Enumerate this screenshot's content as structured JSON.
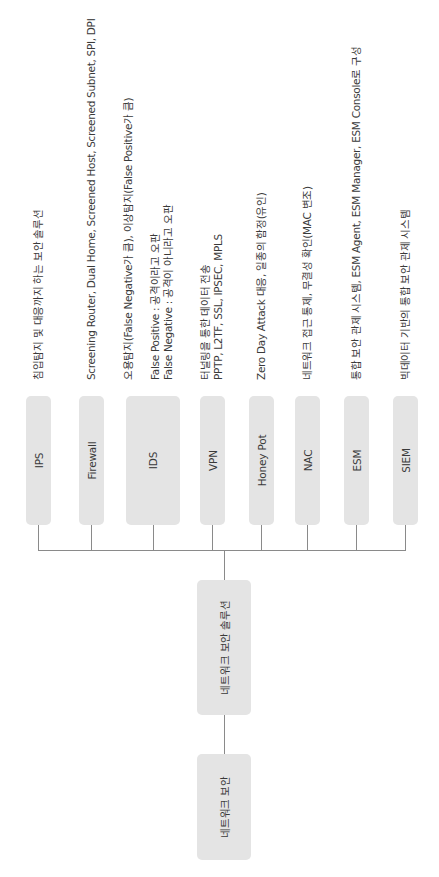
{
  "diagram": {
    "orientation": "rotated-90-ccw",
    "root": {
      "label": "네트워크 보안"
    },
    "middle": {
      "label": "네트워크 보안 솔루션"
    },
    "leaves": [
      {
        "label": "IPS",
        "desc": [
          "침입탐지 및 대응까지 하는 보안 솔루션"
        ]
      },
      {
        "label": "Firewall",
        "desc": [
          "Screening Router, Dual Home, Screened Host, Screened Subnet, SPI, DPI"
        ]
      },
      {
        "label": "IDS",
        "desc": [
          "오용탐지(False Negative가 큼), 이상탐지(False Positive가 큼)",
          "",
          "False Positive : 공격이라고 오판",
          "False Negative : 공격이 아니라고 오판"
        ]
      },
      {
        "label": "VPN",
        "desc": [
          "터널링을 통한 데이터 전송",
          "PPTP, L2TF, SSL, IPSEC, MPLS"
        ]
      },
      {
        "label": "Honey Pot",
        "desc": [
          "Zero Day Attack 대응, 일종의 함정(유인)"
        ]
      },
      {
        "label": "NAC",
        "desc": [
          "네트워크 접근 통제, 무결성 확인(MAC 변조)"
        ]
      },
      {
        "label": "ESM",
        "desc": [
          "통합 보안 관제 시스템, ESM Agent, ESM Manager, ESM Console로 구성"
        ]
      },
      {
        "label": "SIEM",
        "desc": [
          "빅데이터 기반의 통합 보안 관제 시스템"
        ]
      }
    ],
    "colors": {
      "box_fill": "#e4e4e4",
      "line": "#8a8a8a",
      "text": "#3a3a3a",
      "background": "#ffffff"
    }
  }
}
